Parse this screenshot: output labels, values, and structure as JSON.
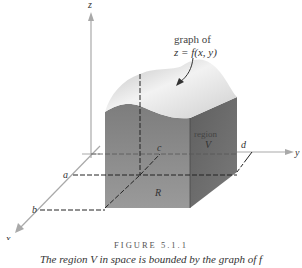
{
  "figure": {
    "axes": {
      "x_label": "x",
      "y_label": "y",
      "z_label": "z"
    },
    "points": {
      "a": "a",
      "b": "b",
      "c": "c",
      "d": "d"
    },
    "annotations": {
      "graph_line1": "graph of",
      "graph_line2": "z = f(x, y)",
      "region_line1": "region",
      "region_line2": "V",
      "base_region": "R"
    },
    "colors": {
      "axis": "#a9a9a9",
      "front_face": "#8a8a8a",
      "side_face": "#6e6e6e",
      "top_surface": "#d9d9d9",
      "dash": "#222222"
    }
  },
  "caption": {
    "title": "FIGURE 5.1.1",
    "text": "The region V in space is bounded by the graph of f"
  }
}
